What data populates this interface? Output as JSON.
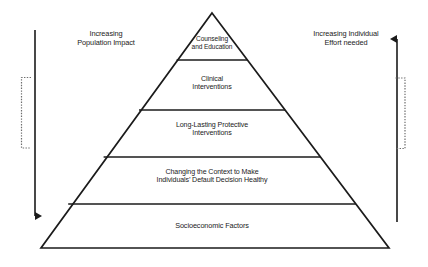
{
  "figure": {
    "type": "health-impact-pyramid",
    "background_color": "#ffffff",
    "stroke_color": "#1b1b1b"
  },
  "pyramid": {
    "tiers": [
      {
        "id": "tier-1",
        "label": "Counseling\nand Education",
        "position": "apex",
        "rank": 1
      },
      {
        "id": "tier-2",
        "label": "Clinical\nInterventions",
        "position": "upper-middle",
        "rank": 2
      },
      {
        "id": "tier-3",
        "label": "Long-Lasting Protective\nInterventions",
        "position": "middle",
        "rank": 3
      },
      {
        "id": "tier-4",
        "label": "Changing the Context to Make\nIndividuals’ Default Decision Healthy",
        "position": "lower-middle",
        "rank": 4
      },
      {
        "id": "tier-5",
        "label": "Socioeconomic Factors",
        "position": "base",
        "rank": 5
      }
    ]
  },
  "left_axis": {
    "label": "Increasing\nPopulation Impact",
    "arrow_direction": "down",
    "bracket": "["
  },
  "right_axis": {
    "label": "Increasing Individual\nEffort needed",
    "arrow_direction": "up",
    "bracket": "]"
  }
}
